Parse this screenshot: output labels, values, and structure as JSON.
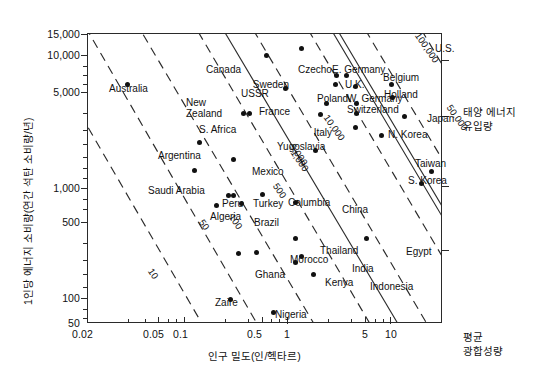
{
  "axes": {
    "y_title": "1인당 에너지 소비량(연간 석탄 소비량/년)",
    "x_title": "인구 밀도(인/헥타르)",
    "y_ticks": [
      "15,000",
      "10,000",
      "5,000",
      "1,000",
      "500",
      "100",
      "50"
    ],
    "x_ticks": [
      "0.02",
      "0.05",
      "0.1",
      "0.5",
      "1",
      "5",
      "10"
    ]
  },
  "annotations": {
    "right_top_line1": "태양 에너지",
    "right_top_line2": "유입량",
    "right_bottom_line1": "평균",
    "right_bottom_line2": "광합성량"
  },
  "chart_data": {
    "type": "scatter",
    "title": "",
    "xlabel": "인구 밀도(인/헥타르)",
    "ylabel": "1인당 에너지 소비량(연간 석탄 소비량/년)",
    "xscale": "log",
    "yscale": "log",
    "xlim": [
      0.02,
      14
    ],
    "ylim": [
      50,
      15000
    ],
    "grid": false,
    "legend": null,
    "xticks": [
      0.02,
      0.05,
      0.1,
      0.5,
      1,
      5,
      10
    ],
    "yticks": [
      50,
      100,
      500,
      1000,
      5000,
      10000,
      15000
    ],
    "points": [
      {
        "name": "Australia",
        "x": 0.042,
        "y": 5500,
        "lx": 109,
        "ly": 83,
        "align": "left"
      },
      {
        "name": "Canada",
        "x": 0.55,
        "y": 9700,
        "lx": 206,
        "ly": 64,
        "align": "left"
      },
      {
        "name": "U.S.",
        "x": 1.05,
        "y": 11000,
        "lx": 435,
        "ly": 43,
        "align": "left"
      },
      {
        "name": "USSR",
        "x": 0.78,
        "y": 5000,
        "lx": 241,
        "ly": 88,
        "align": "left"
      },
      {
        "name": "New Zealand",
        "x": 0.36,
        "y": 3100,
        "lx": 186,
        "ly": 97,
        "align": "left"
      },
      {
        "name": "S. Africa",
        "x": 0.4,
        "y": 3050,
        "lx": 199,
        "ly": 124,
        "align": "left"
      },
      {
        "name": "Czecho",
        "x": 2.0,
        "y": 6500,
        "lx": 298,
        "ly": 64,
        "align": "left"
      },
      {
        "name": "E. Germany",
        "x": 2.4,
        "y": 6500,
        "lx": 332,
        "ly": 64,
        "align": "left"
      },
      {
        "name": "Sweden",
        "x": 1.95,
        "y": 5400,
        "lx": 289,
        "ly": 79,
        "align": "right"
      },
      {
        "name": "U.K.",
        "x": 2.85,
        "y": 5250,
        "lx": 345,
        "ly": 79,
        "align": "left"
      },
      {
        "name": "Belgium",
        "x": 5.5,
        "y": 5400,
        "lx": 383,
        "ly": 72,
        "align": "left"
      },
      {
        "name": "Holland",
        "x": 5.6,
        "y": 4200,
        "lx": 384,
        "ly": 89,
        "align": "left"
      },
      {
        "name": "Poland",
        "x": 1.65,
        "y": 3750,
        "lx": 317,
        "ly": 93,
        "align": "left"
      },
      {
        "name": "W. Germany",
        "x": 2.9,
        "y": 3750,
        "lx": 347,
        "ly": 93,
        "align": "left"
      },
      {
        "name": "France",
        "x": 1.5,
        "y": 3000,
        "lx": 290,
        "ly": 106,
        "align": "right"
      },
      {
        "name": "Switzerland",
        "x": 2.9,
        "y": 3050,
        "lx": 347,
        "ly": 104,
        "align": "left"
      },
      {
        "name": "Italy",
        "x": 2.85,
        "y": 2350,
        "lx": 332,
        "ly": 127,
        "align": "right"
      },
      {
        "name": "Japan",
        "x": 7.0,
        "y": 2900,
        "lx": 427,
        "ly": 113,
        "align": "left"
      },
      {
        "name": "N. Korea",
        "x": 4.6,
        "y": 2000,
        "lx": 388,
        "ly": 129,
        "align": "left"
      },
      {
        "name": "Yugoslavia",
        "x": 1.35,
        "y": 1500,
        "lx": 277,
        "ly": 141,
        "align": "left"
      },
      {
        "name": "Taiwan",
        "x": 11.5,
        "y": 980,
        "lx": 415,
        "ly": 158,
        "align": "left"
      },
      {
        "name": "S. Korea",
        "x": 9.6,
        "y": 780,
        "lx": 408,
        "ly": 175,
        "align": "left"
      },
      {
        "name": "Mexico",
        "x": 0.3,
        "y": 1250,
        "lx": 252,
        "ly": 166,
        "align": "left"
      },
      {
        "name": "Argentina",
        "x": 0.16,
        "y": 1750,
        "lx": 158,
        "ly": 150,
        "align": "left"
      },
      {
        "name": "Saudi Arabia",
        "x": 0.145,
        "y": 1000,
        "lx": 148,
        "ly": 185,
        "align": "left"
      },
      {
        "name": "Peru",
        "x": 0.27,
        "y": 610,
        "lx": 222,
        "ly": 198,
        "align": "left"
      },
      {
        "name": "Turkey",
        "x": 0.3,
        "y": 610,
        "lx": 253,
        "ly": 198,
        "align": "left"
      },
      {
        "name": "Columbia",
        "x": 0.51,
        "y": 620,
        "lx": 288,
        "ly": 197,
        "align": "left"
      },
      {
        "name": "China",
        "x": 0.94,
        "y": 530,
        "lx": 342,
        "ly": 204,
        "align": "left"
      },
      {
        "name": "Algeria",
        "x": 0.22,
        "y": 500,
        "lx": 210,
        "ly": 211,
        "align": "left"
      },
      {
        "name": "Brazil",
        "x": 0.345,
        "y": 520,
        "lx": 254,
        "ly": 217,
        "align": "left"
      },
      {
        "name": "Thailand",
        "x": 0.93,
        "y": 265,
        "lx": 320,
        "ly": 245,
        "align": "left"
      },
      {
        "name": "Egypt",
        "x": 3.5,
        "y": 265,
        "lx": 406,
        "ly": 246,
        "align": "left"
      },
      {
        "name": "Morocco",
        "x": 0.46,
        "y": 200,
        "lx": 290,
        "ly": 254,
        "align": "left"
      },
      {
        "name": "Ghana",
        "x": 0.33,
        "y": 195,
        "lx": 255,
        "ly": 269,
        "align": "left"
      },
      {
        "name": "India",
        "x": 1.05,
        "y": 185,
        "lx": 352,
        "ly": 263,
        "align": "left"
      },
      {
        "name": "Kenya",
        "x": 0.93,
        "y": 165,
        "lx": 325,
        "ly": 277,
        "align": "left"
      },
      {
        "name": "Indonesia",
        "x": 1.3,
        "y": 130,
        "lx": 370,
        "ly": 281,
        "align": "left"
      },
      {
        "name": "Zaire",
        "x": 0.28,
        "y": 80,
        "lx": 215,
        "ly": 297,
        "align": "left"
      },
      {
        "name": "Nigeria",
        "x": 0.62,
        "y": 62,
        "lx": 275,
        "ly": 309,
        "align": "left"
      }
    ],
    "iso_lines": [
      {
        "label": "10",
        "style": "dashed"
      },
      {
        "label": "50",
        "style": "dashed"
      },
      {
        "label": "100",
        "style": "dashed"
      },
      {
        "label": "500",
        "style": "dashed"
      },
      {
        "label": "1,000",
        "style": "dashed"
      },
      {
        "label": "5,000",
        "style": "dashed"
      },
      {
        "label": "10,000",
        "style": "dashed"
      },
      {
        "label": "50,000",
        "style": "dashed"
      },
      {
        "label": "100,000",
        "style": "solid-double"
      }
    ]
  }
}
